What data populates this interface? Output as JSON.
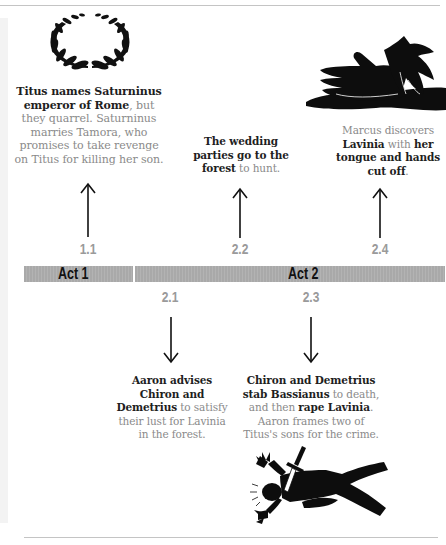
{
  "timeline": {
    "acts": [
      {
        "label": "Act 1"
      },
      {
        "label": "Act 2"
      }
    ],
    "scenes": [
      {
        "id": "1.1",
        "direction": "up"
      },
      {
        "id": "2.1",
        "direction": "down"
      },
      {
        "id": "2.2",
        "direction": "up"
      },
      {
        "id": "2.3",
        "direction": "down"
      },
      {
        "id": "2.4",
        "direction": "up"
      }
    ]
  },
  "events": {
    "e11": {
      "parts": [
        {
          "bold": true,
          "text": "Titus names Saturninus emperor of Rome"
        },
        {
          "bold": false,
          "text": ", but they quarrel. Saturninus marries Tamora, who promises to take revenge on Titus for killing her son."
        }
      ],
      "illustration": "laurel-wreath"
    },
    "e21": {
      "parts": [
        {
          "bold": true,
          "text": "Aaron advises Chiron and Demetrius"
        },
        {
          "bold": false,
          "text": " to satisfy their lust for Lavinia in the forest."
        }
      ]
    },
    "e22": {
      "parts": [
        {
          "bold": true,
          "text": "The wedding parties go to the forest"
        },
        {
          "bold": false,
          "text": " to hunt."
        }
      ]
    },
    "e23": {
      "parts": [
        {
          "bold": true,
          "text": "Chiron and Demetrius stab Bassianus"
        },
        {
          "bold": false,
          "text": " to death, and then "
        },
        {
          "bold": true,
          "text": "rape Lavinia"
        },
        {
          "bold": false,
          "text": ". Aaron frames two of Titus's sons for the crime."
        }
      ],
      "illustration": "stabbed-figure"
    },
    "e24": {
      "parts": [
        {
          "bold": false,
          "text": "Marcus discovers "
        },
        {
          "bold": true,
          "text": "Lavinia"
        },
        {
          "bold": false,
          "text": " with "
        },
        {
          "bold": true,
          "text": "her tongue and hands cut off"
        },
        {
          "bold": false,
          "text": "."
        }
      ],
      "illustration": "severed-hands"
    }
  },
  "colors": {
    "bold_text": "#1e1e1e",
    "body_text": "#8a8a8a",
    "scene_label": "#9a9a9a",
    "act_bar": "#acacac",
    "rule": "#c4c4c4"
  }
}
